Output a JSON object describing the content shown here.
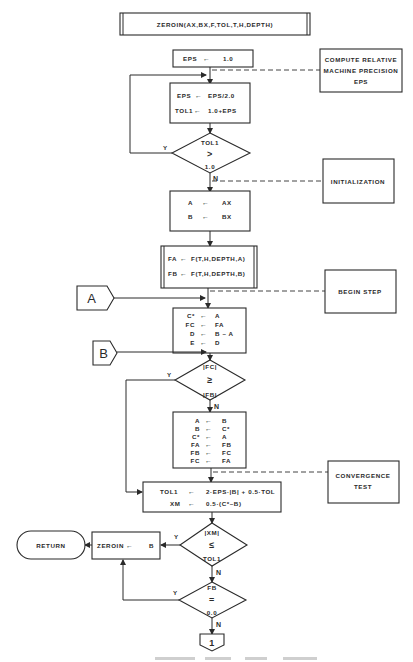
{
  "diagram": {
    "title": "ZEROIN(AX,BX,F,TOL,T,H,DEPTH)",
    "steps": {
      "eps_init": {
        "lhs": "EPS",
        "arrow": "←",
        "rhs": "1.0"
      },
      "eps_loop": [
        {
          "lhs": "EPS",
          "arrow": "←",
          "rhs": "EPS/2.0"
        },
        {
          "lhs": "TOL1",
          "arrow": "←",
          "rhs": "1.0+EPS"
        }
      ],
      "decision_tol1": {
        "top": "TOL1",
        "op": ">",
        "bottom": "1.0",
        "yes": "Y",
        "no": "N"
      },
      "init": [
        {
          "lhs": "A",
          "arrow": "←",
          "rhs": "AX"
        },
        {
          "lhs": "B",
          "arrow": "←",
          "rhs": "BX"
        }
      ],
      "func_eval": [
        {
          "lhs": "FA",
          "arrow": "←",
          "rhs": "F(T,H,DEPTH,A)"
        },
        {
          "lhs": "FB",
          "arrow": "←",
          "rhs": "F(T,H,DEPTH,B)"
        }
      ],
      "begin_step_box": [
        {
          "lhs": "C*",
          "arrow": "←",
          "rhs": "A"
        },
        {
          "lhs": "FC",
          "arrow": "←",
          "rhs": "FA"
        },
        {
          "lhs": "D",
          "arrow": "←",
          "rhs": "B – A"
        },
        {
          "lhs": "E",
          "arrow": "←",
          "rhs": "D"
        }
      ],
      "decision_fc": {
        "top": "|FC|",
        "op": "≥",
        "bottom": "|FB|",
        "yes": "Y",
        "no": "N"
      },
      "swap_box": [
        {
          "lhs": "A",
          "arrow": "←",
          "rhs": "B"
        },
        {
          "lhs": "B",
          "arrow": "←",
          "rhs": "C*"
        },
        {
          "lhs": "C*",
          "arrow": "←",
          "rhs": "A"
        },
        {
          "lhs": "FA",
          "arrow": "←",
          "rhs": "FB"
        },
        {
          "lhs": "FB",
          "arrow": "←",
          "rhs": "FC"
        },
        {
          "lhs": "FC",
          "arrow": "←",
          "rhs": "FA"
        }
      ],
      "convergence_box": [
        {
          "lhs": "TOL1",
          "arrow": "←",
          "rhs": "2·EPS·|B| + 0.5·TOL"
        },
        {
          "lhs": "XM",
          "arrow": "←",
          "rhs": "0.5·(C*–B)"
        }
      ],
      "decision_xm": {
        "top": "|XM|",
        "op": "≤",
        "bottom": "TOL1",
        "yes": "Y",
        "no": "N"
      },
      "decision_fb": {
        "top": "FB",
        "op": "=",
        "bottom": "0.0",
        "yes": "Y",
        "no": "N"
      },
      "result": {
        "lhs": "ZEROIN",
        "arrow": "←",
        "rhs": "B"
      },
      "terminal": "RETURN"
    },
    "connectors": {
      "a": "A",
      "b": "B",
      "off_page": "1"
    },
    "annotations": {
      "machine_precision": [
        "COMPUTE RELATIVE",
        "MACHINE PRECISION",
        "EPS"
      ],
      "initialization": "INITIALIZATION",
      "begin_step": "BEGIN STEP",
      "convergence": [
        "CONVERGENCE",
        "TEST"
      ]
    },
    "colors": {
      "ink": "#2a2a2a",
      "background": "#ffffff"
    }
  }
}
